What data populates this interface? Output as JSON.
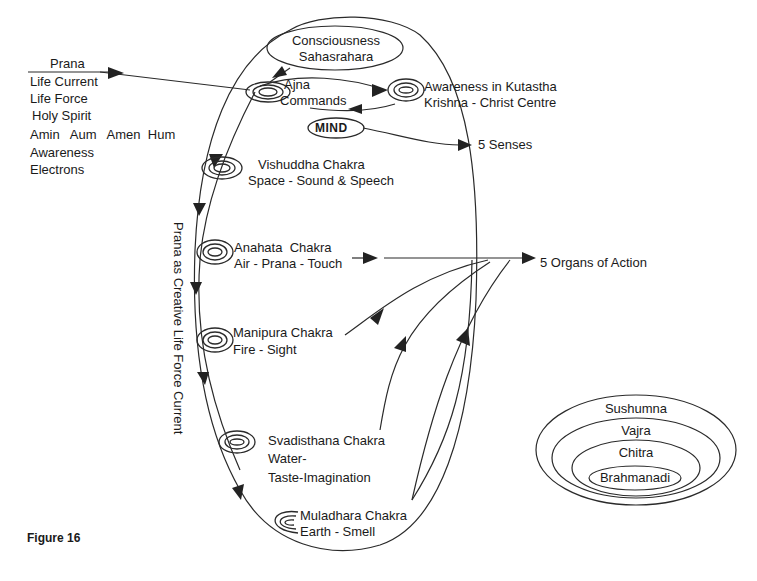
{
  "figure_label": "Figure 16",
  "prana_block": {
    "title": "Prana",
    "lines": [
      "Life Current",
      "Life Force",
      "Holy Spirit",
      "Amin   Aum   Amen  Hum",
      "Awareness",
      "Electrons"
    ]
  },
  "crown": {
    "line1": "Consciousness",
    "line2": "Sahasrahara"
  },
  "ajna": {
    "line1": "Ajna",
    "line2": "Commands"
  },
  "kutastha": {
    "line1": "Awareness in Kutastha",
    "line2": "Krishna - Christ Centre"
  },
  "mind": {
    "label": "MIND"
  },
  "senses": {
    "label": "5 Senses"
  },
  "chakras": [
    {
      "name": "Vishuddha Chakra",
      "attr": "Space - Sound & Speech"
    },
    {
      "name": "Anahata  Chakra",
      "attr": "Air - Prana - Touch"
    },
    {
      "name": "Manipura Chakra",
      "attr": "Fire - Sight"
    },
    {
      "name": "Svadisthana Chakra",
      "attr": "Water-",
      "attr2": "Taste-Imagination"
    },
    {
      "name": "Muladhara Chakra",
      "attr": "Earth - Smell"
    }
  ],
  "organs": {
    "label": "5 Organs of Action"
  },
  "vertical_label": "Prana as Creative Life Force Current",
  "nadis": [
    "Sushumna",
    "Vajra",
    "Chitra",
    "Brahmanadi"
  ],
  "colors": {
    "line": "#222222",
    "text": "#1a1a1a",
    "background": "#ffffff"
  }
}
